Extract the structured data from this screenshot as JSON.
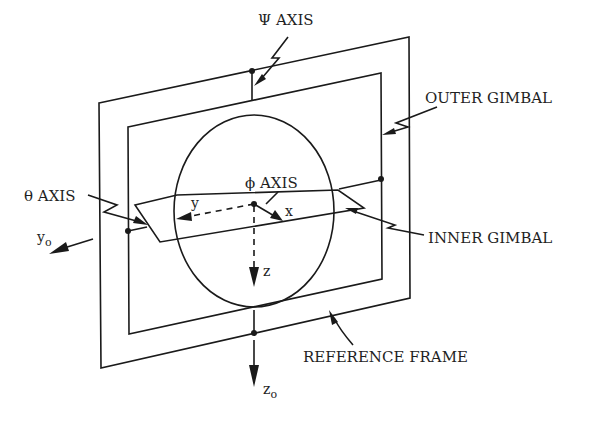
{
  "diagram": {
    "labels": {
      "psi_axis": "Ψ AXIS",
      "outer_gimbal": "OUTER GIMBAL",
      "theta_axis": "θ AXIS",
      "phi_axis": "ϕ AXIS",
      "inner_gimbal": "INNER GIMBAL",
      "reference_frame": "REFERENCE FRAME",
      "y0_base": "y",
      "y0_sub": "o",
      "z0_base": "z",
      "z0_sub": "o",
      "body_y": "y",
      "body_x": "x",
      "body_z": "z"
    },
    "components": [
      "reference-frame",
      "outer-gimbal",
      "inner-gimbal",
      "sphere-body",
      "body-axes"
    ],
    "colors": {
      "line": "#1a1a1a",
      "background": "#ffffff"
    }
  }
}
